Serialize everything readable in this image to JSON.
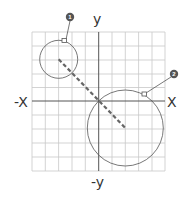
{
  "diagram": {
    "axes": {
      "x_pos_label": "X",
      "x_neg_label": "-X",
      "y_pos_label": "y",
      "y_neg_label": "-y"
    },
    "grid": {
      "columns": 10,
      "rows": 10,
      "line_color": "#c8c8c8",
      "axis_color": "#555555"
    },
    "circles": [
      {
        "id": "1",
        "label": "1",
        "center_grid": [
          -3,
          3
        ],
        "radius_units": 1.4
      },
      {
        "id": "2",
        "label": "2",
        "center_grid": [
          2,
          -2
        ],
        "radius_units": 2.8
      }
    ],
    "connector": {
      "style": "dashed",
      "from": "circle-1-center",
      "to": "circle-2-center",
      "color": "#666666"
    },
    "callouts": [
      {
        "number": "1",
        "target": "circle-1"
      },
      {
        "number": "2",
        "target": "circle-2"
      }
    ]
  }
}
